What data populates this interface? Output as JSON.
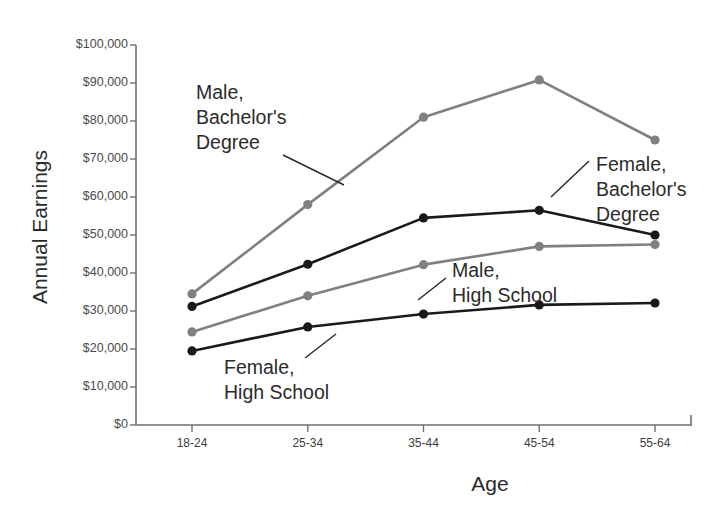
{
  "chart_data": {
    "type": "line",
    "title": "",
    "xlabel": "Age",
    "ylabel": "Annual Earnings",
    "categories": [
      "18-24",
      "25-34",
      "35-44",
      "45-54",
      "55-64"
    ],
    "ylim": [
      0,
      100000
    ],
    "ytick_labels": [
      "$100,000",
      "$90,000",
      "$80,000",
      "$70,000",
      "$60,000",
      "$50,000",
      "$40,000",
      "$30,000",
      "$20,000",
      "$10,000",
      "$0"
    ],
    "ytick_values": [
      100000,
      90000,
      80000,
      70000,
      60000,
      50000,
      40000,
      30000,
      20000,
      10000,
      0
    ],
    "grid": false,
    "legend_position": "inline-annotations",
    "series": [
      {
        "name": "Male, Bachelor's Degree",
        "color": "#808080",
        "values": [
          34500,
          58000,
          81000,
          90800,
          75000
        ]
      },
      {
        "name": "Female, Bachelor's Degree",
        "color": "#1a1a1a",
        "values": [
          31200,
          42300,
          54500,
          56500,
          50000
        ]
      },
      {
        "name": "Male, High School",
        "color": "#808080",
        "values": [
          24500,
          34000,
          42200,
          47000,
          47500
        ]
      },
      {
        "name": "Female, High School",
        "color": "#1a1a1a",
        "values": [
          19500,
          25800,
          29200,
          31600,
          32100
        ]
      }
    ],
    "annotations": [
      {
        "text": "Male,\nBachelor's\nDegree",
        "series": "Male, Bachelor's Degree"
      },
      {
        "text": "Female,\nBachelor's\nDegree",
        "series": "Female, Bachelor's Degree"
      },
      {
        "text": "Male,\nHigh School",
        "series": "Male, High School"
      },
      {
        "text": "Female,\nHigh School",
        "series": "Female, High School"
      }
    ]
  }
}
